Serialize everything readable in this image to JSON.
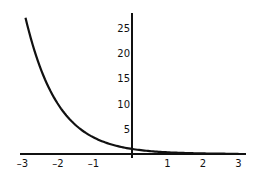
{
  "chart_data": {
    "type": "line",
    "title": "",
    "xlabel": "",
    "ylabel": "",
    "function": "y = 3^(-x)",
    "xlim": [
      -3.1,
      3.2
    ],
    "ylim": [
      0,
      28
    ],
    "grid": false,
    "legend": null,
    "x_ticks": [
      "-3",
      "-2",
      "-1",
      "1",
      "2",
      "3"
    ],
    "y_ticks": [
      "5",
      "10",
      "15",
      "20",
      "25"
    ],
    "series": [
      {
        "name": "3^(-x)",
        "x": [
          -3,
          -2.5,
          -2,
          -1.5,
          -1,
          -0.5,
          0,
          0.5,
          1,
          1.5,
          2,
          2.5,
          3
        ],
        "values": [
          27,
          15.59,
          9,
          5.2,
          3,
          1.73,
          1,
          0.58,
          0.33,
          0.19,
          0.11,
          0.06,
          0.04
        ]
      }
    ],
    "colors": {
      "curve": "#111111",
      "axes": "#111111",
      "background": "#ffffff"
    }
  }
}
